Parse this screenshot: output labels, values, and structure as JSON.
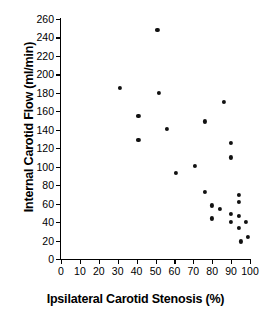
{
  "chart_data": {
    "type": "scatter",
    "title": "",
    "xlabel": "Ipsilateral Carotid Stenosis (%)",
    "ylabel": "Internal Carotid Flow (ml/min)",
    "xlim": [
      0,
      100
    ],
    "ylim": [
      0,
      260
    ],
    "xticks": [
      0,
      10,
      20,
      30,
      40,
      50,
      60,
      70,
      80,
      90,
      100
    ],
    "yticks": [
      0,
      20,
      40,
      60,
      80,
      100,
      120,
      140,
      160,
      180,
      200,
      220,
      240,
      260
    ],
    "grid": false,
    "legend": null,
    "marker": "filled-circle",
    "marker_color": "#111111",
    "series": [
      {
        "name": "patients",
        "points": [
          [
            31,
            185
          ],
          [
            41,
            155
          ],
          [
            41,
            129
          ],
          [
            51,
            248
          ],
          [
            52,
            180
          ],
          [
            56,
            141
          ],
          [
            61,
            93
          ],
          [
            71,
            101
          ],
          [
            76,
            149
          ],
          [
            76,
            73
          ],
          [
            80,
            58
          ],
          [
            80,
            44
          ],
          [
            84,
            54
          ],
          [
            86,
            170
          ],
          [
            90,
            126
          ],
          [
            90,
            110
          ],
          [
            90,
            49
          ],
          [
            90,
            40
          ],
          [
            94,
            69
          ],
          [
            94,
            62
          ],
          [
            94,
            47
          ],
          [
            94,
            34
          ],
          [
            95,
            19
          ],
          [
            98,
            40
          ],
          [
            99,
            24
          ]
        ]
      }
    ]
  }
}
